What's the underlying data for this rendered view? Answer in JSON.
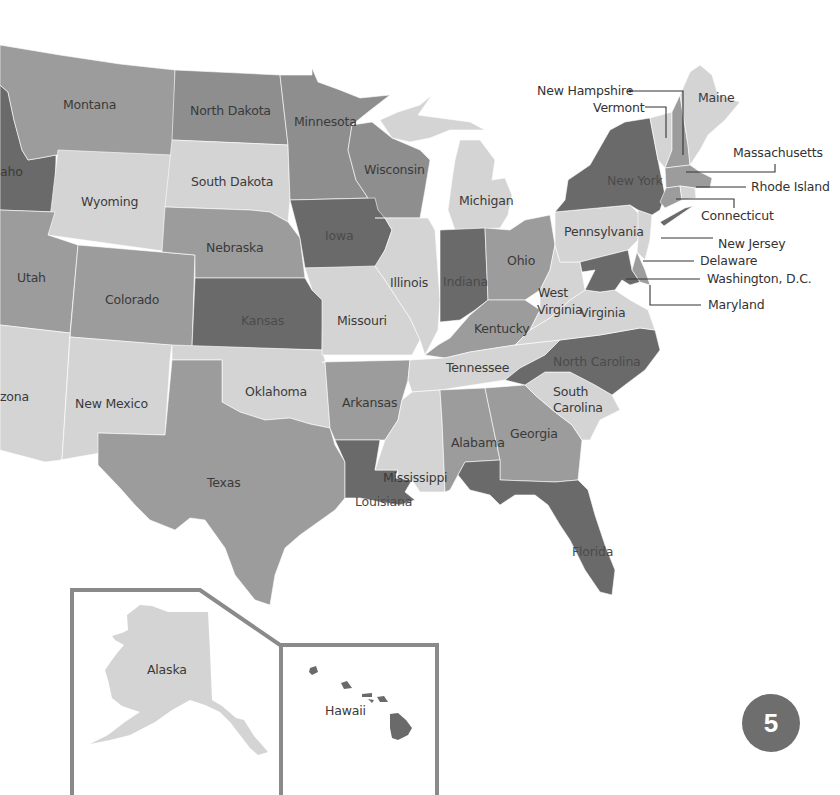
{
  "map": {
    "title": "United States map",
    "states": {
      "montana": "Montana",
      "north_dakota": "North Dakota",
      "minnesota": "Minnesota",
      "idaho": "aho",
      "wyoming": "Wyoming",
      "south_dakota": "South Dakota",
      "wisconsin": "Wisconsin",
      "michigan": "Michigan",
      "utah": "Utah",
      "nebraska": "Nebraska",
      "iowa": "Iowa",
      "illinois": "Illinois",
      "indiana": "Indiana",
      "ohio": "Ohio",
      "pennsylvania": "Pennsylvania",
      "new_york": "New York",
      "maine": "Maine",
      "colorado": "Colorado",
      "kansas": "Kansas",
      "missouri": "Missouri",
      "kentucky": "Kentucky",
      "west_virginia_1": "West",
      "west_virginia_2": "Virginia",
      "virginia": "Virginia",
      "arizona": "zona",
      "new_mexico": "New Mexico",
      "oklahoma": "Oklahoma",
      "arkansas": "Arkansas",
      "tennessee": "Tennessee",
      "north_carolina": "North Carolina",
      "south_carolina_1": "South",
      "south_carolina_2": "Carolina",
      "texas": "Texas",
      "louisiana": "Louisiana",
      "mississippi": "Mississippi",
      "alabama": "Alabama",
      "georgia": "Georgia",
      "florida": "Florida",
      "alaska": "Alaska",
      "hawaii": "Hawaii"
    },
    "callouts": {
      "new_hampshire": "New Hampshire",
      "vermont": "Vermont",
      "massachusetts": "Massachusetts",
      "rhode_island": "Rhode Island",
      "connecticut": "Connecticut",
      "new_jersey": "New Jersey",
      "delaware": "Delaware",
      "washington_dc": "Washington, D.C.",
      "maryland": "Maryland"
    },
    "colors": {
      "light": "#d4d4d4",
      "medium": "#9c9c9c",
      "medium_dark": "#8e8e8e",
      "dark": "#6a6a6a",
      "text": "#3a3a3a",
      "frame": "#8a8a8a"
    }
  },
  "page": {
    "number": "5",
    "badge_color": "#6e6e6e"
  }
}
